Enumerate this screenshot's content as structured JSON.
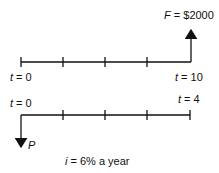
{
  "diagram": {
    "top": {
      "start_var": "t",
      "start_eq": " = 0",
      "end_var": "t",
      "end_eq": " = 10",
      "arrow_var": "F",
      "arrow_eq": " = $2000"
    },
    "bottom": {
      "start_var": "t",
      "start_eq": " = 0",
      "end_var": "t",
      "end_eq": " = 4",
      "arrow_var": "P"
    },
    "rate_var": "i",
    "rate_text": " = 6% a year"
  }
}
